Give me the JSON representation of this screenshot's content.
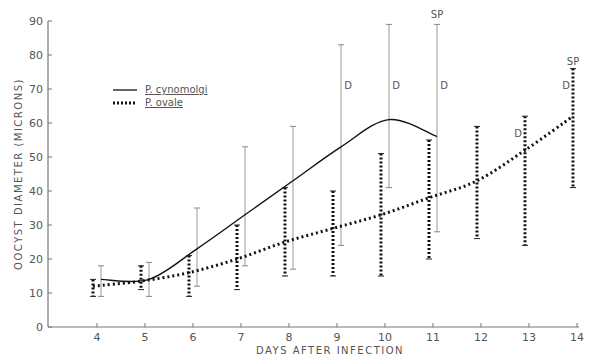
{
  "chart_data": {
    "type": "line",
    "title": "",
    "xlabel": "DAYS AFTER INFECTION",
    "ylabel": "OOCYST DIAMETER (MICRONS)",
    "x_ticks": [
      4,
      5,
      6,
      7,
      8,
      9,
      10,
      11,
      12,
      13,
      14
    ],
    "y_ticks": [
      0,
      10,
      20,
      30,
      40,
      50,
      60,
      70,
      80,
      90
    ],
    "xlim": [
      3,
      14
    ],
    "ylim": [
      0,
      90
    ],
    "grid": false,
    "legend_position": "upper-left",
    "series": [
      {
        "name": "P. cynomolgi",
        "style": "solid",
        "x": [
          4,
          5,
          6,
          7,
          8,
          9,
          10,
          11
        ],
        "mean": [
          14,
          14,
          23,
          33,
          43,
          53,
          61,
          56
        ],
        "low": [
          9,
          9,
          12,
          18,
          17,
          24,
          41,
          28
        ],
        "high": [
          18,
          19,
          35,
          53,
          59,
          83,
          89,
          89
        ],
        "annotations": [
          {
            "x": 9,
            "label": "D",
            "y": 70
          },
          {
            "x": 10,
            "label": "D",
            "y": 70
          },
          {
            "x": 11,
            "label": "D",
            "y": 70
          },
          {
            "x": 11,
            "label": "SP",
            "y": 91
          }
        ]
      },
      {
        "name": "P. ovale",
        "style": "dotted",
        "x": [
          4,
          5,
          6,
          7,
          8,
          9,
          10,
          11,
          12,
          13,
          14
        ],
        "mean": [
          12,
          13.5,
          16,
          20,
          25,
          29,
          33,
          38,
          43,
          52,
          62
        ],
        "low": [
          9,
          11,
          9,
          11,
          15,
          15,
          15,
          20,
          26,
          24,
          41
        ],
        "high": [
          14,
          18,
          21,
          30,
          41,
          40,
          51,
          55,
          59,
          62,
          76
        ],
        "annotations": [
          {
            "x": 13,
            "label": "D",
            "y": 56
          },
          {
            "x": 14,
            "label": "D",
            "y": 70
          },
          {
            "x": 14,
            "label": "SP",
            "y": 77
          }
        ]
      }
    ]
  },
  "legend": {
    "items": [
      {
        "prefix": "P.",
        "name": "cynomolgi"
      },
      {
        "prefix": "P.",
        "name": "ovale"
      }
    ]
  }
}
